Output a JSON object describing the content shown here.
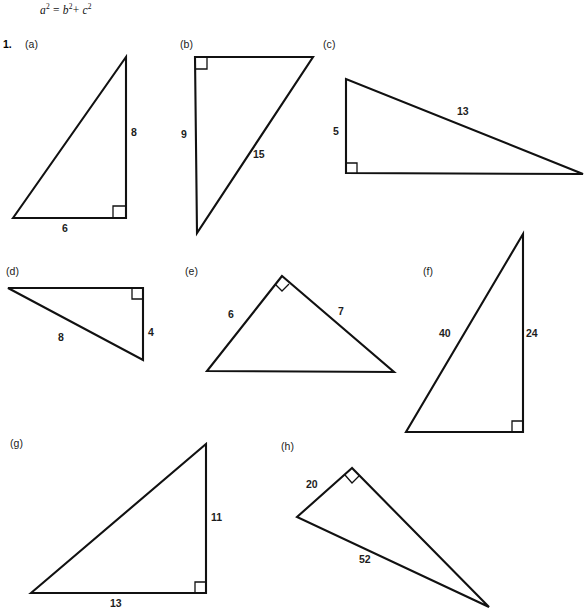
{
  "page": {
    "width": 588,
    "height": 614,
    "background": "#ffffff",
    "ink": "#000000"
  },
  "header": {
    "formula_plain": "a² = b² + c²",
    "formula_parts": {
      "a": "a",
      "exp_a": "2",
      "equals": "=",
      "b": "b",
      "exp_b": "2",
      "plus": "+",
      "c": "c",
      "exp_c": "2"
    }
  },
  "question": {
    "number": "1.",
    "parts": [
      {
        "id": "a",
        "label": "(a)",
        "right_angle_corner": "bottom-right",
        "labels": [
          {
            "text": "8",
            "side": "vertical-right"
          },
          {
            "text": "6",
            "side": "horizontal-bottom"
          }
        ]
      },
      {
        "id": "b",
        "label": "(b)",
        "right_angle_corner": "top-left",
        "labels": [
          {
            "text": "9",
            "side": "vertical-left"
          },
          {
            "text": "15",
            "side": "hypotenuse"
          }
        ]
      },
      {
        "id": "c",
        "label": "(c)",
        "right_angle_corner": "bottom-left",
        "labels": [
          {
            "text": "5",
            "side": "vertical-left"
          },
          {
            "text": "13",
            "side": "hypotenuse"
          }
        ]
      },
      {
        "id": "d",
        "label": "(d)",
        "right_angle_corner": "top-right",
        "labels": [
          {
            "text": "4",
            "side": "vertical-right"
          },
          {
            "text": "8",
            "side": "hypotenuse"
          }
        ]
      },
      {
        "id": "e",
        "label": "(e)",
        "right_angle_corner": "apex",
        "labels": [
          {
            "text": "6",
            "side": "left-leg"
          },
          {
            "text": "7",
            "side": "right-leg"
          }
        ]
      },
      {
        "id": "f",
        "label": "(f)",
        "right_angle_corner": "bottom-right",
        "labels": [
          {
            "text": "40",
            "side": "hypotenuse"
          },
          {
            "text": "24",
            "side": "vertical-right"
          }
        ]
      },
      {
        "id": "g",
        "label": "(g)",
        "right_angle_corner": "bottom-right",
        "labels": [
          {
            "text": "11",
            "side": "vertical-right"
          },
          {
            "text": "13",
            "side": "horizontal-bottom"
          }
        ]
      },
      {
        "id": "h",
        "label": "(h)",
        "right_angle_corner": "apex",
        "labels": [
          {
            "text": "20",
            "side": "left-leg"
          },
          {
            "text": "52",
            "side": "long-side"
          }
        ]
      }
    ]
  }
}
